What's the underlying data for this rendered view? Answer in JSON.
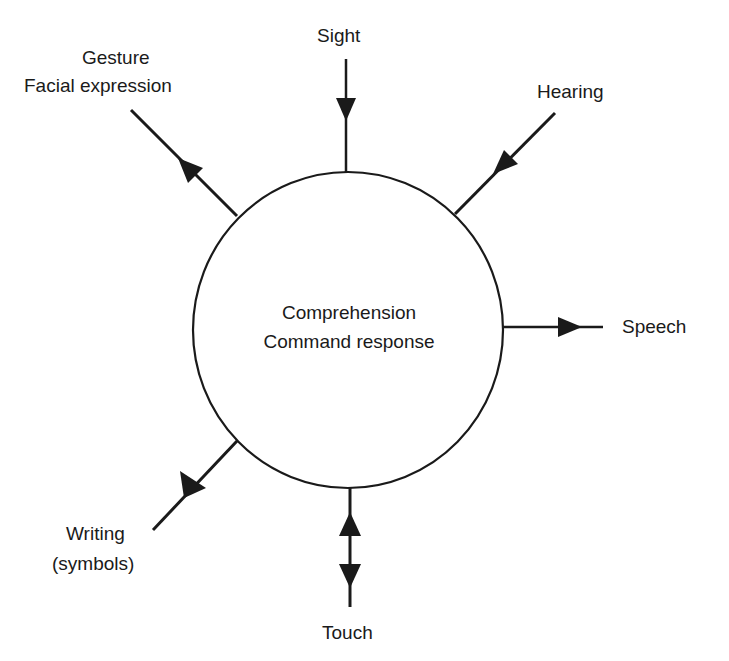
{
  "diagram": {
    "center": {
      "line1": "Comprehension",
      "line2": "Command response"
    },
    "channels": [
      {
        "id": "gesture",
        "line1": "Gesture",
        "line2": "Facial expression",
        "direction": "outward"
      },
      {
        "id": "sight",
        "label": "Sight",
        "direction": "inward"
      },
      {
        "id": "hearing",
        "label": "Hearing",
        "direction": "inward"
      },
      {
        "id": "speech",
        "label": "Speech",
        "direction": "outward"
      },
      {
        "id": "touch",
        "label": "Touch",
        "direction": "bidirectional"
      },
      {
        "id": "writing",
        "line1": "Writing",
        "line2": "(symbols)",
        "direction": "outward"
      }
    ]
  }
}
